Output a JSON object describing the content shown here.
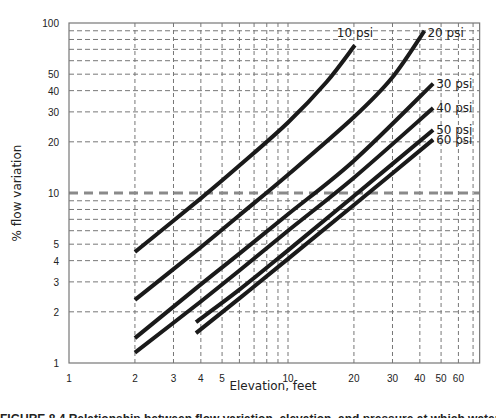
{
  "chart_data": {
    "type": "line",
    "title": "",
    "xlabel": "Elevation, feet",
    "ylabel": "% flow variation",
    "xscale": "log",
    "yscale": "log",
    "xlim": [
      1,
      75
    ],
    "ylim": [
      1,
      100
    ],
    "grid": true,
    "legend_position": "inline labels at line ends",
    "x_ticks": [
      1,
      2,
      3,
      4,
      5,
      10,
      20,
      30,
      40,
      50,
      60
    ],
    "x_tick_labels": [
      "1",
      "2",
      "3",
      "4",
      "5",
      "10",
      "20",
      "30",
      "40",
      "50",
      "60"
    ],
    "x_minor_gridlines": [
      2,
      3,
      4,
      5,
      6,
      7,
      8,
      9,
      10,
      20,
      30,
      40,
      50,
      60,
      70
    ],
    "y_ticks": [
      1,
      2,
      3,
      4,
      5,
      10,
      20,
      30,
      40,
      50,
      100
    ],
    "y_tick_labels": [
      "1",
      "2",
      "3",
      "4",
      "5",
      "10",
      "20",
      "30",
      "40",
      "50",
      "100"
    ],
    "y_minor_gridlines": [
      2,
      3,
      4,
      5,
      6,
      7,
      8,
      9,
      20,
      30,
      40,
      50,
      60,
      70,
      80,
      90
    ],
    "reference_line": {
      "y": 10,
      "style": "dashed-bold",
      "color": "#888888"
    },
    "series": [
      {
        "name": "10 psi",
        "label": "10 psi",
        "x": [
          2,
          4,
          6,
          10,
          15,
          20.2
        ],
        "y": [
          4.5,
          9.3,
          14.5,
          26,
          45,
          74
        ]
      },
      {
        "name": "20 psi",
        "label": "20 psi",
        "x": [
          2,
          4,
          6,
          10,
          20,
          30,
          42
        ],
        "y": [
          2.35,
          4.8,
          7.4,
          12.8,
          28,
          48,
          90
        ]
      },
      {
        "name": "30 psi",
        "label": "30 psi",
        "x": [
          2,
          4,
          6,
          10,
          20,
          46
        ],
        "y": [
          1.4,
          2.9,
          4.4,
          7.5,
          15.5,
          44
        ]
      },
      {
        "name": "40 psi",
        "label": "40 psi",
        "x": [
          2,
          4,
          6,
          10,
          20,
          46
        ],
        "y": [
          1.15,
          2.3,
          3.5,
          6,
          12.3,
          31.6
        ]
      },
      {
        "name": "50 psi",
        "label": "50 psi",
        "x": [
          3.8,
          6,
          10,
          20,
          46
        ],
        "y": [
          1.74,
          2.7,
          4.6,
          9.6,
          23.5
        ]
      },
      {
        "name": "60 psi",
        "label": "60 psi",
        "x": [
          3.8,
          6,
          10,
          20,
          46
        ],
        "y": [
          1.5,
          2.4,
          4.1,
          8.5,
          20.6
        ]
      }
    ],
    "colors": {
      "line": "#1a1a1a",
      "grid": "#777777",
      "frame": "#777777",
      "reference": "#8a8a8a"
    }
  },
  "caption": "FIGURE 8.4  Relationship between flow variation, elevation, and pressure at which water is supplied."
}
